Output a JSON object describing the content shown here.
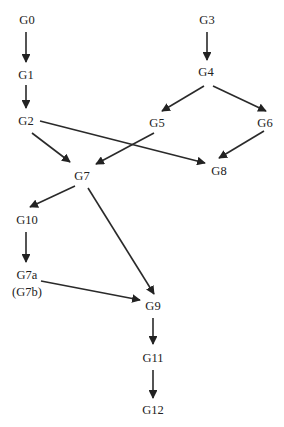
{
  "diagram": {
    "type": "directed-graph",
    "colors": {
      "ink": "#222222",
      "background": "#ffffff"
    },
    "nodes": [
      {
        "id": "G0",
        "label": "G0",
        "x": 27,
        "y": 20
      },
      {
        "id": "G1",
        "label": "G1",
        "x": 26,
        "y": 75
      },
      {
        "id": "G2",
        "label": "G2",
        "x": 26,
        "y": 121
      },
      {
        "id": "G3",
        "label": "G3",
        "x": 207,
        "y": 20
      },
      {
        "id": "G4",
        "label": "G4",
        "x": 206,
        "y": 72
      },
      {
        "id": "G5",
        "label": "G5",
        "x": 157,
        "y": 123
      },
      {
        "id": "G6",
        "label": "G6",
        "x": 265,
        "y": 123
      },
      {
        "id": "G7",
        "label": "G7",
        "x": 82,
        "y": 176
      },
      {
        "id": "G8",
        "label": "G8",
        "x": 219,
        "y": 171
      },
      {
        "id": "G10",
        "label": "G10",
        "x": 27,
        "y": 220
      },
      {
        "id": "G7a",
        "label": "G7a",
        "sublabel": "(G7b)",
        "x": 27,
        "y": 283
      },
      {
        "id": "G9",
        "label": "G9",
        "x": 153,
        "y": 306
      },
      {
        "id": "G11",
        "label": "G11",
        "x": 153,
        "y": 358
      },
      {
        "id": "G12",
        "label": "G12",
        "x": 153,
        "y": 410
      }
    ],
    "edges": [
      {
        "from": "G0",
        "to": "G1",
        "x1": 26,
        "y1": 32,
        "x2": 26,
        "y2": 62
      },
      {
        "from": "G1",
        "to": "G2",
        "x1": 26,
        "y1": 85,
        "x2": 26,
        "y2": 108
      },
      {
        "from": "G3",
        "to": "G4",
        "x1": 207,
        "y1": 32,
        "x2": 207,
        "y2": 60
      },
      {
        "from": "G4",
        "to": "G5",
        "x1": 204,
        "y1": 86,
        "x2": 162,
        "y2": 111
      },
      {
        "from": "G4",
        "to": "G6",
        "x1": 213,
        "y1": 86,
        "x2": 266,
        "y2": 111
      },
      {
        "from": "G2",
        "to": "G7",
        "x1": 32,
        "y1": 133,
        "x2": 70,
        "y2": 162
      },
      {
        "from": "G2",
        "to": "G8",
        "x1": 40,
        "y1": 121,
        "x2": 205,
        "y2": 163
      },
      {
        "from": "G5",
        "to": "G7",
        "x1": 154,
        "y1": 133,
        "x2": 96,
        "y2": 164
      },
      {
        "from": "G6",
        "to": "G8",
        "x1": 264,
        "y1": 131,
        "x2": 219,
        "y2": 158
      },
      {
        "from": "G7",
        "to": "G10",
        "x1": 75,
        "y1": 186,
        "x2": 30,
        "y2": 207
      },
      {
        "from": "G7",
        "to": "G9",
        "x1": 88,
        "y1": 188,
        "x2": 154,
        "y2": 294
      },
      {
        "from": "G10",
        "to": "G7a",
        "x1": 26,
        "y1": 232,
        "x2": 26,
        "y2": 262
      },
      {
        "from": "G7a",
        "to": "G9",
        "x1": 41,
        "y1": 281,
        "x2": 140,
        "y2": 300
      },
      {
        "from": "G9",
        "to": "G11",
        "x1": 153,
        "y1": 318,
        "x2": 153,
        "y2": 344
      },
      {
        "from": "G11",
        "to": "G12",
        "x1": 153,
        "y1": 370,
        "x2": 153,
        "y2": 398
      }
    ]
  }
}
